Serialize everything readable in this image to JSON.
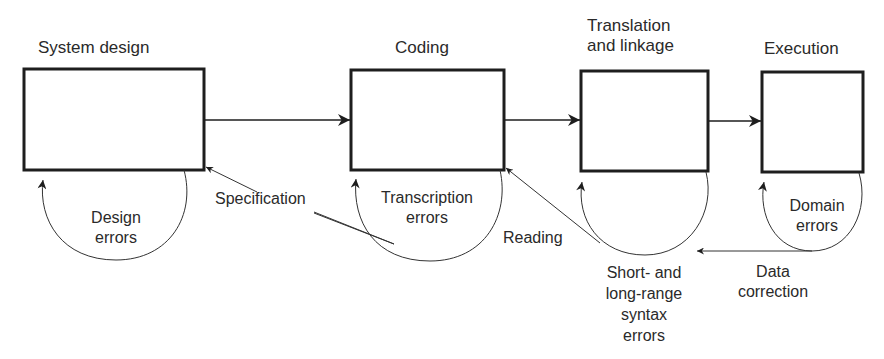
{
  "diagram": {
    "stages": [
      {
        "id": "system-design",
        "title": "System design"
      },
      {
        "id": "coding",
        "title": "Coding"
      },
      {
        "id": "translation",
        "title_line1": "Translation",
        "title_line2": "and linkage"
      },
      {
        "id": "execution",
        "title": "Execution"
      }
    ],
    "loops": {
      "design_errors": {
        "line1": "Design",
        "line2": "errors"
      },
      "transcription_errors": {
        "line1": "Transcription",
        "line2": "errors"
      },
      "syntax_errors": {
        "line1": "Short- and",
        "line2": "long-range",
        "line3": "syntax",
        "line4": "errors"
      },
      "domain_errors": {
        "line1": "Domain",
        "line2": "errors"
      }
    },
    "feedback_edges": {
      "specification": "Specification",
      "reading": "Reading",
      "data_correction_line1": "Data",
      "data_correction_line2": "correction"
    },
    "colors": {
      "stroke": "#1e1e1e",
      "text": "#2a2a2a",
      "background": "#ffffff"
    }
  }
}
